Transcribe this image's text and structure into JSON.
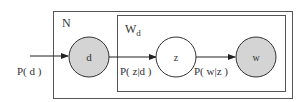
{
  "diagram": {
    "type": "plate-notation",
    "plates": {
      "outer": {
        "label": "N"
      },
      "inner": {
        "label_base": "W",
        "label_sub": "d"
      }
    },
    "nodes": {
      "d": {
        "label": "d",
        "observed": true
      },
      "z": {
        "label": "z",
        "observed": false
      },
      "w": {
        "label": "w",
        "observed": true
      }
    },
    "edges": {
      "prior": {
        "label": "P( d )"
      },
      "d_to_z": {
        "label": "P( z|d )"
      },
      "z_to_w": {
        "label": "P( w|z )"
      }
    },
    "colors": {
      "observed_fill": "#d4d4d4",
      "stroke": "#333333",
      "plate_stroke": "#555555"
    }
  }
}
